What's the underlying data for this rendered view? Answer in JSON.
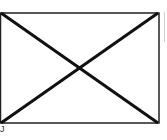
{
  "figure": {
    "type": "image-placeholder",
    "icon": "crossed-box-icon",
    "stroke_color": "#111111",
    "background": "#ffffff",
    "caption": "J"
  }
}
